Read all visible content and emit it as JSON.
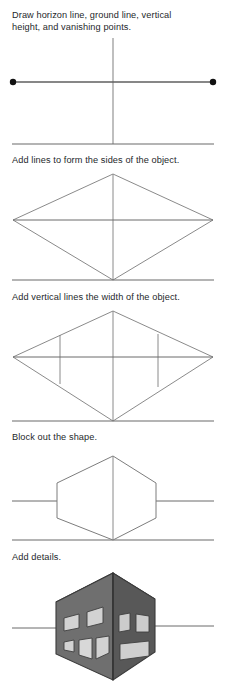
{
  "page": {
    "width": 226,
    "height": 698,
    "background": "#ffffff"
  },
  "colors": {
    "line": "#6b6b6b",
    "horizon_line": "#6a6a6a",
    "ground_line": "#6a6a6a",
    "construction_line": "#7d7d7d",
    "vanishing_point": "#111111",
    "text": "#25282b",
    "building_left_face": "#6f6f6f",
    "building_right_face": "#585858",
    "building_top_face": "#8d8d8d",
    "building_edge": "#3b3b3b",
    "window_fill": "#d2d2d2",
    "window_fill_dark": "#bdbdbd",
    "window_outline": "#3f3f3f"
  },
  "steps": [
    {
      "index": 1,
      "caption": "Draw horizon line, ground line, vertical\nheight, and vanishing points.",
      "caption_y": 10,
      "stage_y": 30,
      "stage_height": 118,
      "geometry": {
        "horizon_y": 52,
        "ground_y": 114,
        "vertical_x": 113,
        "vertical_top": 8,
        "vertical_bottom": 114,
        "left_vanishing_point": {
          "x": 13,
          "y": 52
        },
        "right_vanishing_point": {
          "x": 213,
          "y": 52
        },
        "vanishing_point_radius": 3.2,
        "horizon_x1": 13,
        "horizon_x2": 213,
        "ground_x1": 12,
        "ground_x2": 214
      }
    },
    {
      "index": 2,
      "caption": "Add lines to form the sides of the object.",
      "caption_y": 155,
      "stage_y": 168,
      "stage_height": 116,
      "geometry": {
        "horizon_y": 52,
        "ground_y": 112,
        "vertical_x": 113,
        "vertical_top": 6,
        "vertical_bottom": 112,
        "left_vanishing_point": {
          "x": 13,
          "y": 52
        },
        "right_vanishing_point": {
          "x": 213,
          "y": 52
        },
        "apex_top": {
          "x": 113,
          "y": 6
        },
        "apex_bottom": {
          "x": 113,
          "y": 112
        },
        "horizon_x1": 13,
        "horizon_x2": 213,
        "ground_x1": 12,
        "ground_x2": 214
      }
    },
    {
      "index": 3,
      "caption": "Add vertical lines the width of the object.",
      "caption_y": 292,
      "stage_y": 305,
      "stage_height": 118,
      "geometry": {
        "horizon_y": 52,
        "ground_y": 116,
        "vertical_x": 113,
        "vertical_top": 6,
        "vertical_bottom": 116,
        "left_vanishing_point": {
          "x": 13,
          "y": 52
        },
        "right_vanishing_point": {
          "x": 213,
          "y": 52
        },
        "apex_top": {
          "x": 113,
          "y": 6
        },
        "apex_bottom": {
          "x": 113,
          "y": 116
        },
        "width_line_left_x": 60,
        "width_line_right_x": 158,
        "horizon_x1": 13,
        "horizon_x2": 213,
        "ground_x1": 12,
        "ground_x2": 214
      }
    },
    {
      "index": 4,
      "caption": "Block out the shape.",
      "caption_y": 432,
      "stage_y": 448,
      "stage_height": 97,
      "geometry": {
        "horizon_y": 53,
        "ground_y": 92,
        "vertical_x": 113,
        "apex_top": {
          "x": 113,
          "y": 8
        },
        "apex_bottom": {
          "x": 113,
          "y": 92
        },
        "left_corner_top": {
          "x": 57,
          "y": 35
        },
        "left_corner_bottom": {
          "x": 57,
          "y": 70
        },
        "right_corner_top": {
          "x": 156,
          "y": 35
        },
        "right_corner_bottom": {
          "x": 156,
          "y": 70
        },
        "horizon_x1": 12,
        "horizon_x2": 214,
        "ground_x1": 12,
        "ground_x2": 214
      }
    },
    {
      "index": 5,
      "caption": "Add details.",
      "caption_y": 552,
      "stage_y": 562,
      "stage_height": 132,
      "geometry": {
        "horizon_y": 66,
        "horizon_x1": 12,
        "horizon_x2": 214,
        "apex_top": {
          "x": 113,
          "y": 11
        },
        "apex_bottom": {
          "x": 113,
          "y": 118
        },
        "left_corner_top": {
          "x": 56,
          "y": 40
        },
        "left_corner_bottom": {
          "x": 56,
          "y": 92
        },
        "right_corner_top": {
          "x": 155,
          "y": 37
        },
        "right_corner_bottom": {
          "x": 155,
          "y": 90
        },
        "top_back_point": {
          "x": 104,
          "y": 4
        }
      },
      "building": {
        "left_face_windows": [
          {
            "x": 64,
            "y": 54,
            "w": 15,
            "h": 14,
            "skew": "upper-left-1"
          },
          {
            "x": 86,
            "y": 48,
            "w": 16,
            "h": 16,
            "skew": "upper-left-2"
          },
          {
            "x": 64,
            "y": 77,
            "w": 10,
            "h": 13,
            "skew": "lower-left-1"
          },
          {
            "x": 79,
            "y": 76,
            "w": 13,
            "h": 19,
            "skew": "door"
          },
          {
            "x": 95,
            "y": 75,
            "w": 13,
            "h": 16,
            "skew": "lower-left-2"
          }
        ],
        "right_face_windows": [
          {
            "x": 119,
            "y": 51,
            "w": 11,
            "h": 17,
            "skew": "upper-right-1"
          },
          {
            "x": 135,
            "y": 53,
            "w": 13,
            "h": 17,
            "skew": "upper-right-2"
          },
          {
            "x": 120,
            "y": 80,
            "w": 29,
            "h": 15,
            "skew": "lower-right-wide"
          }
        ]
      }
    }
  ]
}
